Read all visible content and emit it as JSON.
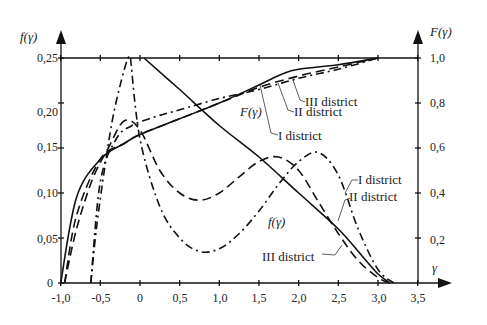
{
  "chart_data": {
    "type": "line",
    "title": "",
    "xlabel": "γ",
    "ylabel_left": "f(γ)",
    "ylabel_right": "F(γ)",
    "xlim": [
      -1.0,
      3.5
    ],
    "ylim_left": [
      0,
      0.25
    ],
    "ylim_right": [
      0,
      1.0
    ],
    "grid": false,
    "x_ticks": [
      "-1,0",
      "-0,5",
      "0",
      "0,5",
      "1,0",
      "1,5",
      "2,0",
      "2,5",
      "3,0",
      "3,5"
    ],
    "x_tick_values": [
      -1.0,
      -0.5,
      0,
      0.5,
      1.0,
      1.5,
      2.0,
      2.5,
      3.0,
      3.5
    ],
    "y_left_ticks": [
      "0",
      "0,05",
      "0,10",
      "0,15",
      "0,20",
      "0,25"
    ],
    "y_left_tick_values": [
      0,
      0.05,
      0.1,
      0.15,
      0.2,
      0.25
    ],
    "y_right_ticks": [
      "0,2",
      "0,4",
      "0,6",
      "0,8",
      "1,0"
    ],
    "y_right_tick_values": [
      0.2,
      0.4,
      0.6,
      0.8,
      1.0
    ],
    "series": [
      {
        "name": "f(γ) I district",
        "axis": "left",
        "style": "dashdot",
        "x": [
          -0.62,
          -0.55,
          -0.45,
          -0.35,
          -0.25,
          -0.15,
          -0.1
        ],
        "y": [
          0,
          0.06,
          0.125,
          0.18,
          0.22,
          0.25,
          0.25
        ],
        "x2": [
          -0.12,
          0.0,
          0.25,
          0.5,
          0.75,
          1.0,
          1.25,
          1.5,
          1.75,
          2.0,
          2.25,
          2.5,
          2.75,
          3.0,
          3.2
        ],
        "y2": [
          0.25,
          0.16,
          0.085,
          0.05,
          0.035,
          0.038,
          0.055,
          0.08,
          0.11,
          0.135,
          0.145,
          0.12,
          0.06,
          0.015,
          0.0
        ]
      },
      {
        "name": "f(γ) II district",
        "axis": "left",
        "style": "dashed",
        "x": [
          -0.95,
          -0.8,
          -0.6,
          -0.4,
          -0.2,
          0.0,
          0.25,
          0.5,
          0.75,
          1.0,
          1.25,
          1.5,
          1.75,
          2.0,
          2.25,
          2.5,
          2.75,
          3.0,
          3.15
        ],
        "y": [
          0,
          0.06,
          0.115,
          0.15,
          0.18,
          0.17,
          0.125,
          0.1,
          0.092,
          0.1,
          0.118,
          0.135,
          0.14,
          0.125,
          0.09,
          0.055,
          0.025,
          0.006,
          0
        ]
      },
      {
        "name": "f(γ) III district",
        "axis": "left",
        "style": "solid",
        "x": [
          0.05,
          0.5,
          1.0,
          1.5,
          2.0,
          2.5,
          2.8,
          3.0,
          3.15
        ],
        "y": [
          0.25,
          0.215,
          0.175,
          0.14,
          0.1,
          0.06,
          0.03,
          0.01,
          0
        ]
      },
      {
        "name": "F(γ) I district",
        "axis": "right",
        "style": "dashdot",
        "x": [
          -0.62,
          -0.5,
          -0.3,
          -0.1,
          0.2,
          0.5,
          1.0,
          1.5,
          2.0,
          2.5,
          3.0
        ],
        "y": [
          0,
          0.45,
          0.64,
          0.7,
          0.74,
          0.77,
          0.82,
          0.86,
          0.91,
          0.95,
          1.0
        ]
      },
      {
        "name": "F(γ) II district",
        "axis": "right",
        "style": "dashed",
        "x": [
          -0.95,
          -0.8,
          -0.5,
          -0.2,
          0.0,
          0.5,
          1.0,
          1.5,
          2.0,
          2.5,
          3.0
        ],
        "y": [
          0,
          0.3,
          0.55,
          0.62,
          0.66,
          0.73,
          0.8,
          0.87,
          0.92,
          0.96,
          1.0
        ]
      },
      {
        "name": "F(γ) III district",
        "axis": "right",
        "style": "solid",
        "x": [
          -1.0,
          -0.8,
          -0.5,
          -0.2,
          0.0,
          0.5,
          1.0,
          1.5,
          1.8,
          2.0,
          2.5,
          3.0
        ],
        "y": [
          0,
          0.38,
          0.55,
          0.62,
          0.66,
          0.73,
          0.8,
          0.88,
          0.93,
          0.95,
          0.97,
          1.0
        ]
      }
    ],
    "annotations": [
      "F(γ)",
      "f(γ)",
      "I district",
      "II district",
      "III district",
      "I district",
      "II district",
      "III district"
    ]
  },
  "labels": {
    "y_left_title": "f(γ)",
    "y_right_title": "F(γ)",
    "x_title": "γ",
    "F_curve_label": "F(γ)",
    "f_curve_label": "f(γ)",
    "F_I": "I district",
    "F_II": "II district",
    "F_III": "III district",
    "f_I": "I district",
    "f_II": "II district",
    "f_III": "III district"
  },
  "ticks": {
    "x": [
      "-1,0",
      "-0,5",
      "0",
      "0,5",
      "1,0",
      "1,5",
      "2,0",
      "2,5",
      "3,0",
      "3,5"
    ],
    "yl": [
      "0",
      "0,05",
      "0,10",
      "0,15",
      "0,20",
      "0,25"
    ],
    "yr": [
      "0,2",
      "0,4",
      "0,6",
      "0,8",
      "1,0"
    ]
  }
}
